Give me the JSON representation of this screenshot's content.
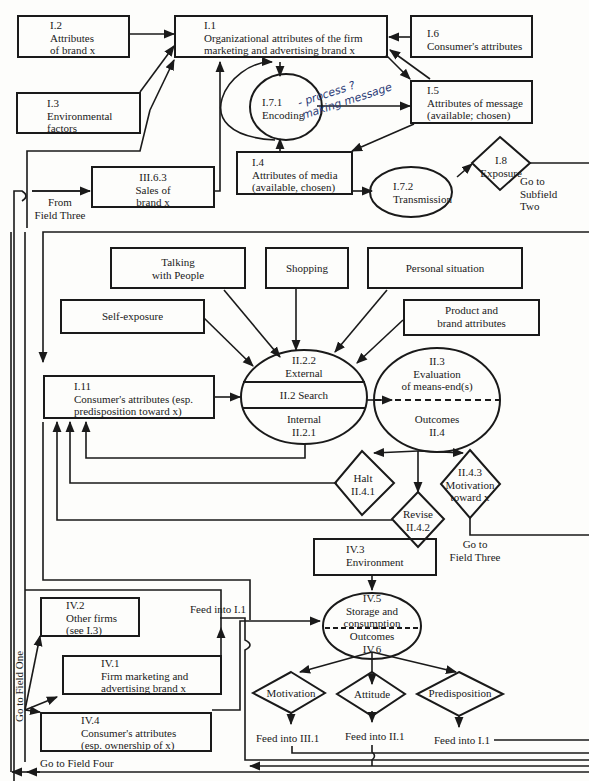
{
  "diagram": {
    "type": "flowchart",
    "colors": {
      "line": "#1a1a1a",
      "background": "#fdfdfb",
      "handwriting": "#2c3c78"
    }
  },
  "field_one": {
    "i1": {
      "id": "I.1",
      "text_1": "Organizational attributes of the firm",
      "text_2": "marketing and advertising brand x"
    },
    "i2": {
      "id": "I.2",
      "text_1": "Attributes",
      "text_2": "of brand x"
    },
    "i3": {
      "id": "I.3",
      "text_1": "Environmental",
      "text_2": "factors"
    },
    "i6": {
      "id": "I.6",
      "text_1": "Consumer's attributes"
    },
    "i5": {
      "id": "I.5",
      "text_1": "Attributes of message",
      "text_2": "(available; chosen)"
    },
    "i71": {
      "id": "I.7.1",
      "text_1": "Encoding"
    },
    "i4": {
      "id": "I.4",
      "text_1": "Attributes of media",
      "text_2": "(available, chosen)"
    },
    "i72": {
      "id": "I.7.2",
      "text_1": "Transmission"
    },
    "i8": {
      "id": "I.8",
      "text_1": "Exposure"
    },
    "iii63": {
      "id": "III.6.3",
      "text_1": "Sales of",
      "text_2": "brand x"
    },
    "from_field_three": {
      "line_1": "From",
      "line_2": "Field Three"
    },
    "go_subfield_two": {
      "line_1": "Go to",
      "line_2": "Subfield",
      "line_3": "Two"
    },
    "handwritten_note": {
      "line_1": "- process ?",
      "line_2": "making message"
    }
  },
  "field_two": {
    "talking": {
      "line_1": "Talking",
      "line_2": "with People"
    },
    "shopping": {
      "line_1": "Shopping"
    },
    "personal": {
      "line_1": "Personal situation"
    },
    "self_exposure": {
      "line_1": "Self-exposure"
    },
    "product_brand": {
      "line_1": "Product and",
      "line_2": "brand attributes"
    },
    "i11": {
      "id": "I.11",
      "text_1": "Consumer's attributes (esp.",
      "text_2": "predisposition toward x)"
    },
    "search": {
      "external_id": "II.2.2",
      "external": "External",
      "middle": "II.2 Search",
      "internal": "Internal",
      "internal_id": "II.2.1"
    },
    "evaluation": {
      "id": "II.3",
      "line_1": "Evaluation",
      "line_2": "of means-end(s)",
      "outcomes": "Outcomes",
      "outcomes_id": "II.4"
    },
    "halt": {
      "line_1": "Halt",
      "line_2": "II.4.1"
    },
    "revise": {
      "line_1": "Revise",
      "line_2": "II.4.2"
    },
    "motivation_toward": {
      "line_1": "II.4.3",
      "line_2": "Motivation",
      "line_3": "toward x"
    },
    "go_field_three": {
      "line_1": "Go to",
      "line_2": "Field Three"
    }
  },
  "field_four": {
    "iv3": {
      "id": "IV.3",
      "text_1": "Environment"
    },
    "iv2": {
      "id": "IV.2",
      "text_1": "Other firms",
      "text_2": "(see I.3)"
    },
    "iv1": {
      "id": "IV.1",
      "text_1": "Firm marketing and",
      "text_2": "advertising brand x"
    },
    "iv4": {
      "id": "IV.4",
      "text_1": "Consumer's attributes",
      "text_2": "(esp. ownership of x)"
    },
    "feed_i1_top": "Feed into I.1",
    "storage": {
      "id": "IV.5",
      "line_1": "Storage and",
      "line_2": "consumption",
      "outcomes": "Outcomes",
      "outcomes_id": "IV.6"
    },
    "motivation": "Motivation",
    "attitude": "Attitude",
    "predisposition": "Predisposition",
    "feed_iii1": "Feed into III.1",
    "feed_ii1": "Feed into II.1",
    "feed_i1": "Feed into I.1",
    "go_field_one": "Go to Field One",
    "go_field_four": "Go to Field Four"
  }
}
